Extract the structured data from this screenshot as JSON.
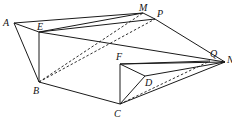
{
  "diagram": {
    "type": "solid-geometry",
    "vertices": {
      "A": {
        "label": "A",
        "x": 14,
        "y": 23
      },
      "E": {
        "label": "E",
        "x": 39,
        "y": 32
      },
      "M": {
        "label": "M",
        "x": 143,
        "y": 13
      },
      "P": {
        "label": "P",
        "x": 155,
        "y": 19
      },
      "B": {
        "label": "B",
        "x": 39,
        "y": 82
      },
      "F": {
        "label": "F",
        "x": 120,
        "y": 64
      },
      "Q": {
        "label": "Q",
        "x": 210,
        "y": 61
      },
      "N": {
        "label": "N",
        "x": 225,
        "y": 62
      },
      "D": {
        "label": "D",
        "x": 145,
        "y": 76
      },
      "C": {
        "label": "C",
        "x": 120,
        "y": 104
      }
    },
    "solid_edges": [
      [
        "A",
        "M"
      ],
      [
        "A",
        "E"
      ],
      [
        "A",
        "B"
      ],
      [
        "E",
        "M"
      ],
      [
        "E",
        "P"
      ],
      [
        "M",
        "P"
      ],
      [
        "E",
        "B"
      ],
      [
        "E",
        "N"
      ],
      [
        "P",
        "N"
      ],
      [
        "B",
        "C"
      ],
      [
        "F",
        "C"
      ],
      [
        "F",
        "N"
      ],
      [
        "F",
        "Q"
      ],
      [
        "F",
        "D"
      ],
      [
        "D",
        "N"
      ],
      [
        "D",
        "C"
      ],
      [
        "C",
        "N"
      ]
    ],
    "dashed_edges": [
      [
        "B",
        "M"
      ],
      [
        "B",
        "P"
      ],
      [
        "C",
        "Q"
      ]
    ],
    "colors": {
      "line": "#1a1a1a",
      "background": "#ffffff"
    }
  }
}
